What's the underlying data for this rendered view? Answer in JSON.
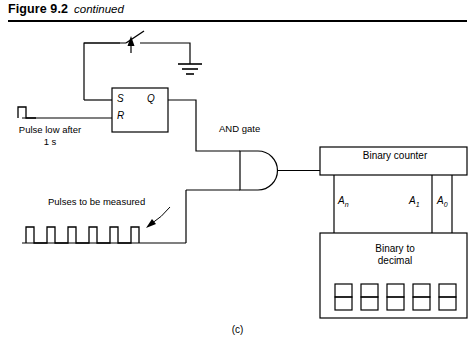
{
  "figure": {
    "label": "Figure 9.2",
    "continued": "continued",
    "caption": "(c)"
  },
  "components": {
    "flipflop": {
      "name": "SR flip-flop",
      "inputs": [
        {
          "id": "s",
          "label": "S"
        },
        {
          "id": "r",
          "label": "R"
        }
      ],
      "outputs": [
        {
          "id": "q",
          "label": "Q"
        }
      ]
    },
    "and_gate": {
      "label": "AND gate"
    },
    "binary_counter": {
      "label": "Binary counter"
    },
    "binary_to_decimal": {
      "label": "Binary to\ndecimal",
      "line1": "Binary to",
      "line2": "decimal",
      "digit_count": 5
    },
    "switch": {
      "name": "switch"
    },
    "ground": {
      "name": "ground"
    }
  },
  "signals": {
    "pulse_low": {
      "line1": "Pulse low after",
      "line2": "1 s"
    },
    "pulses_measured": {
      "label": "Pulses to be measured",
      "pulse_count": 6
    }
  },
  "bus_labels": [
    {
      "id": "an",
      "base": "A",
      "sub": "n"
    },
    {
      "id": "a1",
      "base": "A",
      "sub": "1"
    },
    {
      "id": "a0",
      "base": "A",
      "sub": "0"
    }
  ],
  "colors": {
    "ink": "#000000",
    "background": "#ffffff"
  }
}
